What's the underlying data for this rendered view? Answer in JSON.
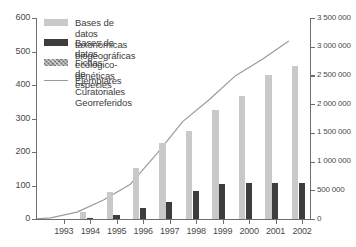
{
  "chart_data": {
    "type": "bar",
    "title": "",
    "xlabel": "",
    "ylabel": "",
    "categories": [
      "1993",
      "1994",
      "1995",
      "1996",
      "1997",
      "1998",
      "1999",
      "2000",
      "2001",
      "2002"
    ],
    "x_tick_labels": [
      "1993",
      "1994",
      "1995",
      "1996",
      "1997",
      "1998",
      "1999",
      "2000",
      "2001",
      "2002"
    ],
    "left_axis": {
      "label": "",
      "ylim": [
        0,
        600
      ],
      "tick_step": 100,
      "ticks": [
        0,
        100,
        200,
        300,
        400,
        500,
        600
      ],
      "tick_labels": [
        "0",
        "100",
        "200",
        "300",
        "400",
        "500",
        "600"
      ]
    },
    "right_axis": {
      "label": "",
      "ylim": [
        0,
        3500000
      ],
      "tick_step": 500000,
      "ticks": [
        0,
        500000,
        1000000,
        1500000,
        2000000,
        2500000,
        3000000,
        3500000
      ],
      "tick_labels": [
        "0",
        "500 000",
        "1 000 000",
        "1 500 000",
        "2 000 000",
        "2 500 000",
        "3 000 000",
        "3 500 000"
      ]
    },
    "grid": false,
    "legend_position": "upper-left",
    "series": [
      {
        "name": "Bases de datos taxonómicas biogeográficas",
        "type": "bar",
        "axis": "left",
        "color": "#c9c9c9",
        "values": [
          20,
          82,
          153,
          226,
          264,
          326,
          368,
          430,
          457,
          512
        ]
      },
      {
        "name": "Bases de datos ecológico-genéticas",
        "type": "bar",
        "axis": "left",
        "color": "#3d3d3d",
        "values": [
          2,
          13,
          32,
          50,
          84,
          105,
          108,
          108,
          108,
          113
        ]
      },
      {
        "name": "Fichas de especies",
        "type": "bar",
        "axis": "left",
        "color": "#a3a3a3",
        "values": [
          0,
          0,
          0,
          0,
          0,
          0,
          0,
          0,
          0,
          128
        ]
      },
      {
        "name": "Ejemplares Curatoriales Georreferidos",
        "type": "line",
        "axis": "right",
        "color": "#9a9a9a",
        "values": [
          20000,
          120000,
          330000,
          600000,
          1130000,
          1700000,
          2080000,
          2500000,
          2780000,
          3100000
        ]
      }
    ]
  },
  "legend": {
    "entries": [
      {
        "label": "Bases de datos taxonómicas biogeográficas",
        "marker": "bar-light"
      },
      {
        "label": "Bases de datos ecológico-genéticas",
        "marker": "bar-dark"
      },
      {
        "label": "Fichas de especies",
        "marker": "bar-hatched"
      },
      {
        "label": "Ejemplares Curatoriales\nGeorreferidos",
        "marker": "line"
      }
    ]
  }
}
